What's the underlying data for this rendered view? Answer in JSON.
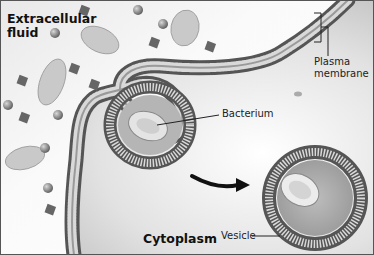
{
  "figure": {
    "regions": {
      "extracellular": "Extracellular fluid",
      "extracellular_line1": "Extracellular",
      "extracellular_line2": "fluid",
      "cytoplasm": "Cytoplasm"
    },
    "labels": {
      "plasma_membrane_line1": "Plasma",
      "plasma_membrane_line2": "membrane",
      "bacterium": "Bacterium",
      "vesicle": "Vesicle"
    },
    "colors": {
      "membrane_dark": "#5a5a5a",
      "membrane_light": "#bdbdbd",
      "cytoplasm": "#cfcfcf",
      "extracellular": "#f6f6f6",
      "particle": "#7a7a7a",
      "border": "#444444"
    }
  }
}
